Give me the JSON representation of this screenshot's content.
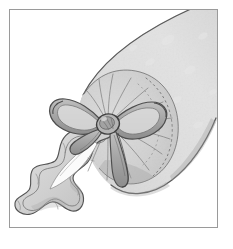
{
  "image": {
    "title": "Wrapped cylindrical package tied with a ribbon bow",
    "medium": "grayscale pen-and-ink line drawing with gray wash",
    "orientation": "portrait",
    "frame": {
      "style": "thin rectangular rule",
      "border_color": "#9a9a9a",
      "background_color": "#ffffff",
      "inset_left": 9,
      "inset_top": 9,
      "width": 209,
      "height": 219
    },
    "palette": {
      "paper_white": "#ffffff",
      "wrapper_fill": "#c9c9c9",
      "wrapper_fill_light": "#d8d8d8",
      "wrapper_shadow": "#a8a8a8",
      "gathered_fill": "#bfbfbf",
      "ribbon_fill": "#b0b0b0",
      "ribbon_dark": "#8a8a8a",
      "ruffle_fill": "#d2d2d2",
      "highlight_white": "#fbfbfb",
      "ink_line": "#4a4a4a",
      "ink_line_soft": "#777777",
      "stitch_dots": "#8f8f8f"
    },
    "subjects": [
      {
        "name": "wrapper-tube",
        "label": "Cylindrical wrapped tube",
        "description": "Long gray cylinder running diagonally from the lower-left gathered end up and off the top-right corner of the frame",
        "fill": "#c9c9c9",
        "texture": "subtle mottled speckle highlights"
      },
      {
        "name": "gathered-end",
        "label": "Gathered fabric end",
        "description": "Fan of pleats radiating from the tied knot, forming a rounded disc at the end of the tube",
        "fill": "#bfbfbf",
        "pleat_count": 18
      },
      {
        "name": "ribbon-bow",
        "label": "Ribbon bow",
        "description": "Two-loop bow with central knot and two trailing tails, tied at the gathered end",
        "loops": 2,
        "tails": 2,
        "fill": "#b0b0b0"
      },
      {
        "name": "ruffle-frill",
        "label": "Ruffled frill",
        "description": "Wavy lobed frill of fabric spilling toward the lower-left, with a bright white highlight wedge",
        "fill": "#d2d2d2",
        "lobes": 6
      },
      {
        "name": "stitch-arc",
        "label": "Dotted stitching arc",
        "description": "Dotted arc curving around the right side of the gathered disc suggesting a seam",
        "color": "#8f8f8f"
      }
    ]
  }
}
